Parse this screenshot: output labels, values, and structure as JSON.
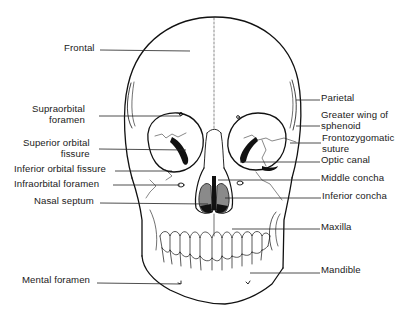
{
  "diagram": {
    "colors": {
      "line": "#111111",
      "fill_dark": "#111111",
      "fill_grey": "#8a8a8a",
      "background": "#ffffff"
    }
  },
  "labels_left": [
    {
      "id": "frontal",
      "lines": [
        "Frontal"
      ],
      "x": 64,
      "y": 43,
      "leader": [
        100,
        50,
        190,
        51
      ]
    },
    {
      "id": "supraorbital-foramen",
      "lines": [
        "Supraorbital",
        "foramen"
      ],
      "x": 32,
      "y": 104,
      "leader": [
        99,
        116,
        181,
        116
      ]
    },
    {
      "id": "superior-orbital-fissure",
      "lines": [
        "Superior orbital",
        "fissure"
      ],
      "x": 23,
      "y": 138,
      "leader": [
        99,
        149,
        186,
        150
      ]
    },
    {
      "id": "inferior-orbital-fissure",
      "lines": [
        "Inferior orbital fissure"
      ],
      "x": 14,
      "y": 164,
      "leader": [
        115,
        171,
        172,
        171
      ]
    },
    {
      "id": "infraorbital-foramen",
      "lines": [
        "Infraorbital foramen"
      ],
      "x": 14,
      "y": 179,
      "leader": [
        113,
        185,
        180,
        185
      ]
    },
    {
      "id": "nasal-septum",
      "lines": [
        "Nasal septum"
      ],
      "x": 34,
      "y": 196,
      "leader": [
        100,
        203,
        208,
        204
      ]
    },
    {
      "id": "mental-foramen",
      "lines": [
        "Mental foramen"
      ],
      "x": 22,
      "y": 275,
      "leader": [
        97,
        283,
        180,
        284
      ]
    }
  ],
  "labels_right": [
    {
      "id": "parietal",
      "lines": [
        "Parietal"
      ],
      "x": 321,
      "y": 93,
      "leader": [
        296,
        100,
        320,
        100
      ]
    },
    {
      "id": "greater-wing-sphenoid",
      "lines": [
        "Greater wing of",
        "sphenoid"
      ],
      "x": 321,
      "y": 110,
      "leader": [
        296,
        126,
        320,
        126
      ]
    },
    {
      "id": "frontozygomatic-suture",
      "lines": [
        "Frontozygomatic",
        "suture"
      ],
      "x": 322,
      "y": 133,
      "leader": [
        290,
        143,
        321,
        143
      ]
    },
    {
      "id": "optic-canal",
      "lines": [
        "Optic canal"
      ],
      "x": 321,
      "y": 155,
      "leader": [
        240,
        162,
        320,
        162
      ]
    },
    {
      "id": "middle-concha",
      "lines": [
        "Middle concha"
      ],
      "x": 321,
      "y": 173,
      "leader": [
        218,
        180,
        320,
        180
      ]
    },
    {
      "id": "inferior-concha",
      "lines": [
        "Inferior concha"
      ],
      "x": 322,
      "y": 191,
      "leader": [
        225,
        198,
        321,
        198
      ]
    },
    {
      "id": "maxilla",
      "lines": [
        "Maxilla"
      ],
      "x": 321,
      "y": 222,
      "leader": [
        232,
        229,
        320,
        229
      ]
    },
    {
      "id": "mandible",
      "lines": [
        "Mandible"
      ],
      "x": 321,
      "y": 265,
      "leader": [
        250,
        273,
        320,
        273
      ]
    }
  ]
}
